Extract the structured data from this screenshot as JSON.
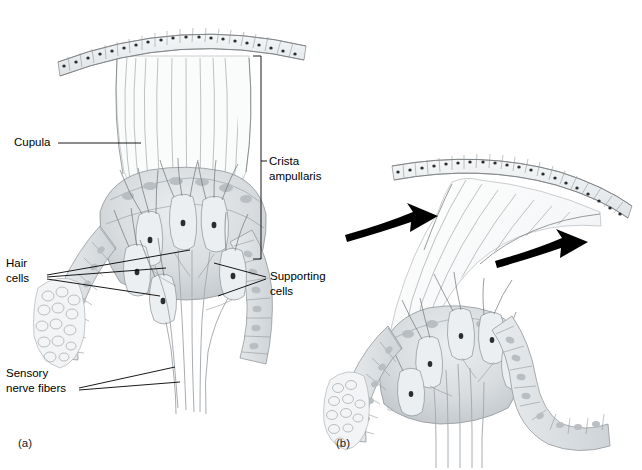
{
  "figure": {
    "background_color": "#ffffff",
    "width": 642,
    "height": 470,
    "ink_color": "#000000",
    "arrow_color": "#000000"
  },
  "panels": [
    {
      "id": "a",
      "letter": "(a)",
      "caption": "Crista ampullaris at rest with cupula upright",
      "x": 18,
      "y": 443
    },
    {
      "id": "b",
      "letter": "(b)",
      "caption": "Cupula deflected by endolymph movement",
      "x": 336,
      "y": 443
    }
  ],
  "labels": [
    {
      "name": "cupula",
      "lines": [
        "Cupula"
      ],
      "x": 14,
      "y": 143,
      "anchor": "start",
      "panel": "a"
    },
    {
      "name": "crista-ampullaris",
      "lines": [
        "Crista",
        "ampullaris"
      ],
      "x": 268,
      "y": 163,
      "anchor": "start",
      "panel": "a"
    },
    {
      "name": "hair-cells",
      "lines": [
        "Hair",
        "cells"
      ],
      "x": 6,
      "y": 264,
      "anchor": "start",
      "panel": "a"
    },
    {
      "name": "supporting-cells",
      "lines": [
        "Supporting",
        "cells"
      ],
      "x": 270,
      "y": 276,
      "anchor": "start",
      "panel": "a"
    },
    {
      "name": "sensory-nerve-fibers",
      "lines": [
        "Sensory",
        "nerve fibers"
      ],
      "x": 6,
      "y": 374,
      "anchor": "start",
      "panel": "a"
    }
  ],
  "arrows": [
    {
      "name": "endolymph-flow-arrow-left",
      "meaning": "endolymph flow direction",
      "panel": "b"
    },
    {
      "name": "endolymph-flow-arrow-right",
      "meaning": "endolymph flow direction",
      "panel": "b"
    }
  ],
  "structures": {
    "epithelium_cell_count_panel_a": 21,
    "epithelium_cell_count_panel_b": 20,
    "hair_cell_count_panel_a": 6,
    "nerve_fiber_count": 6
  }
}
